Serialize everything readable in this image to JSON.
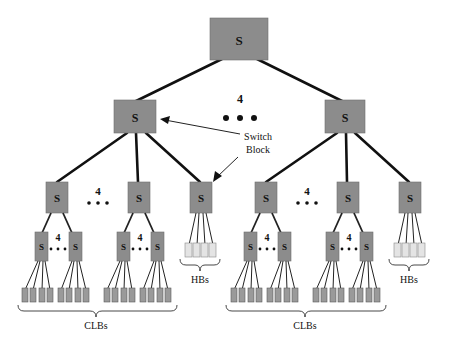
{
  "diagram": {
    "type": "hierarchical-interconnect-tree",
    "switch_label": "S",
    "top_fanout_label": "4",
    "mid_fanout_label": "4",
    "low_fanout_label": "4",
    "annotation": {
      "line1": "Switch",
      "line2": "Block"
    },
    "group_labels": {
      "clbs_left": "CLBs",
      "hbs_left": "HBs",
      "clbs_right": "CLBs",
      "hbs_right": "HBs"
    },
    "colors": {
      "switch_fill": "#8c8c8c",
      "clb_fill": "#9a9a9a",
      "hb_fill": "#e4e4e4",
      "edge": "#111111"
    }
  }
}
